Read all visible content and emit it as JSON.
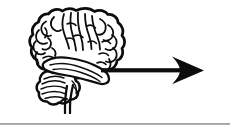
{
  "figure": {
    "background_color": "#ffffff",
    "ink_color": "#0d0d0d",
    "divider_color": "#8e8e8e",
    "caption": ""
  },
  "brain": {
    "label": "human brain lateral view line drawing",
    "parts": [
      {
        "name": "cerebrum",
        "label": "Cerebrum"
      },
      {
        "name": "cerebellum",
        "label": "Cerebellum"
      },
      {
        "name": "brainstem",
        "label": "Brain stem"
      }
    ]
  },
  "arrow": {
    "label": "right pointing arrow",
    "direction": "right",
    "color": "#0d0d0d",
    "shaft_length_px": 78,
    "head_length_px": 30
  },
  "divider": {
    "label": "horizontal rule",
    "color": "#8e8e8e"
  }
}
